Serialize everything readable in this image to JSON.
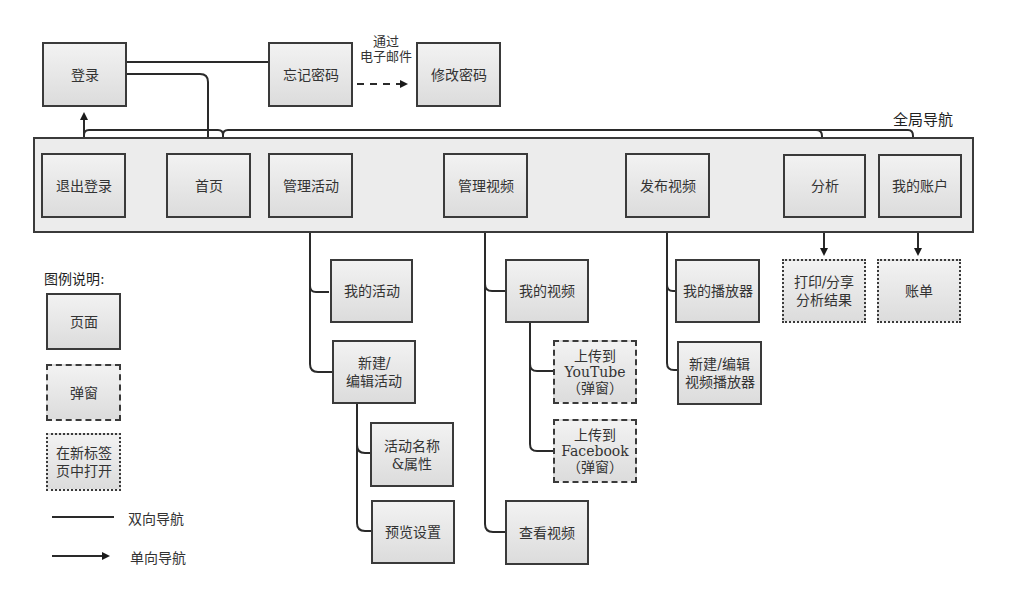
{
  "diagram": {
    "type": "site-navigation-map",
    "global_nav_title": "全局导航",
    "top_pages": {
      "login": "登录",
      "forgot_password": "忘记密码",
      "change_password": "修改密码",
      "email_edge_label": "通过\n电子邮件"
    },
    "global_nav": [
      {
        "id": "logout",
        "label": "退出登录"
      },
      {
        "id": "home",
        "label": "首页"
      },
      {
        "id": "manage_events",
        "label": "管理活动"
      },
      {
        "id": "manage_videos",
        "label": "管理视频"
      },
      {
        "id": "publish_video",
        "label": "发布视频"
      },
      {
        "id": "analytics",
        "label": "分析"
      },
      {
        "id": "my_account",
        "label": "我的账户"
      }
    ],
    "children": {
      "manage_events": [
        {
          "id": "my_events",
          "label": "我的活动",
          "kind": "page"
        },
        {
          "id": "new_edit_event",
          "label": "新建/\n编辑活动",
          "kind": "page",
          "children": [
            {
              "id": "event_name_props",
              "label": "活动名称\n&属性",
              "kind": "page"
            },
            {
              "id": "preview_settings",
              "label": "预览设置",
              "kind": "page"
            }
          ]
        }
      ],
      "manage_videos": [
        {
          "id": "my_videos",
          "label": "我的视频",
          "kind": "page",
          "children": [
            {
              "id": "upload_youtube",
              "label": "上传到\nYouTube\n（弹窗）",
              "kind": "popup"
            },
            {
              "id": "upload_facebook",
              "label": "上传到\nFacebook\n（弹窗）",
              "kind": "popup"
            }
          ]
        },
        {
          "id": "view_videos",
          "label": "查看视频",
          "kind": "page"
        }
      ],
      "publish_video": [
        {
          "id": "my_players",
          "label": "我的播放器",
          "kind": "page"
        },
        {
          "id": "new_edit_player",
          "label": "新建/编辑\n视频播放器",
          "kind": "page"
        }
      ],
      "analytics": [
        {
          "id": "print_share",
          "label": "打印/分享\n分析结果",
          "kind": "newtab"
        }
      ],
      "my_account": [
        {
          "id": "billing",
          "label": "账单",
          "kind": "newtab"
        }
      ]
    },
    "legend": {
      "title": "图例说明:",
      "page": "页面",
      "popup": "弹窗",
      "newtab": "在新标签\n页中打开",
      "two_way": "双向导航",
      "one_way": "单向导航"
    }
  }
}
